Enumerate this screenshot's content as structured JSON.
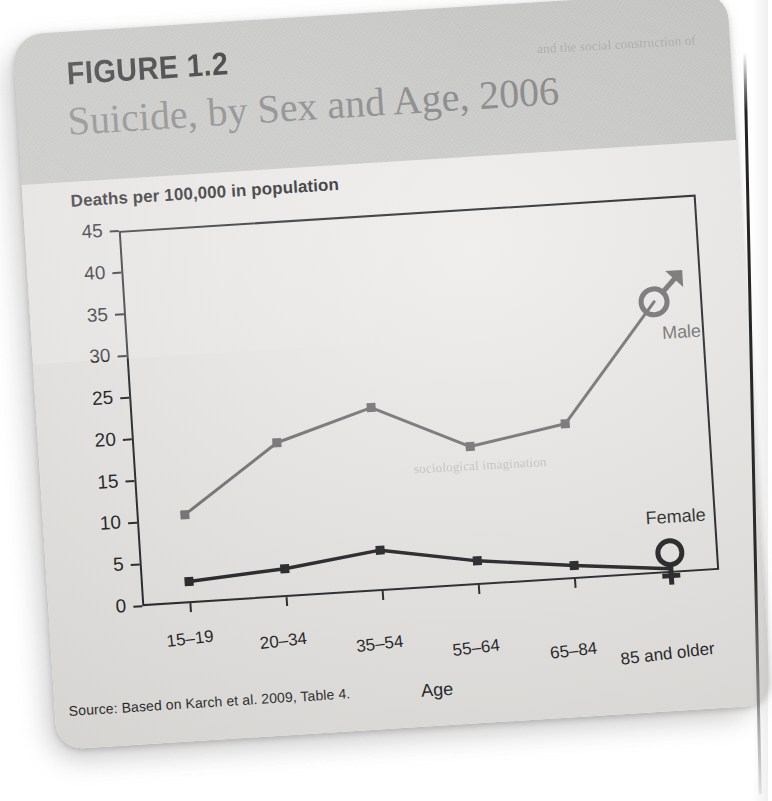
{
  "figure": {
    "label": "FIGURE 1.2",
    "title": "Suicide, by Sex and Age, 2006",
    "source": "Source: Based on Karch et al. 2009, Table 4."
  },
  "showthrough": {
    "top": "and the social construction of",
    "mid": "sociological imagination"
  },
  "colors": {
    "male_line": "#6d6d6d",
    "female_line": "#18191b",
    "axis": "#1b1c1e",
    "page_band": "#c9c9c7",
    "plot_bg": "#eeecea",
    "text": "#131416"
  },
  "chart_data": {
    "type": "line",
    "title": "Suicide, by Sex and Age, 2006",
    "subtitle": "Deaths per 100,000 in population",
    "xlabel": "Age",
    "ylabel": "Deaths per 100,000 in population",
    "categories": [
      "15–19",
      "20–34",
      "35–54",
      "55–64",
      "65–84",
      "85 and older"
    ],
    "ylim": [
      0,
      45
    ],
    "yticks": [
      0,
      5,
      10,
      15,
      20,
      25,
      30,
      35,
      40,
      45
    ],
    "grid": false,
    "legend": "inline-end-of-line",
    "series": [
      {
        "name": "Male",
        "marker": "square",
        "end_symbol": "mars-symbol",
        "color": "#6d6d6d",
        "values": [
          10.6,
          18.5,
          22.0,
          16.6,
          18.6,
          32.5
        ]
      },
      {
        "name": "Female",
        "marker": "square",
        "end_symbol": "venus-symbol",
        "color": "#18191b",
        "values": [
          2.6,
          3.4,
          4.9,
          2.9,
          1.6,
          0.5
        ]
      }
    ]
  }
}
